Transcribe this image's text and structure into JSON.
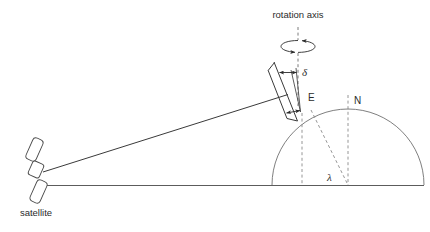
{
  "figure": {
    "type": "diagram",
    "background_color": "#ffffff",
    "line_color": "#3a3a3a",
    "dashed_color": "#8a8a8a",
    "dome_color": "#707070",
    "label_color": "#2b2b2b",
    "width": 430,
    "height": 232
  },
  "labels": {
    "rotation_axis": "rotation axis",
    "delta": "δ",
    "elevation": "E",
    "north": "N",
    "lambda": "λ",
    "satellite": "satellite"
  },
  "elements": {
    "rotation_axis_icon": "rotation-arrow-ellipse",
    "satellite_icon": "satellite-body-with-two-solar-panels",
    "earth_icon": "earth-dome-semicircle",
    "antenna_icon": "tilted-antenna-dish",
    "beam_icon": "satellite-signal-beam-line",
    "ground_icon": "horizontal-ground-line"
  },
  "geometry": {
    "ground_line": {
      "x1": 45,
      "y1": 185,
      "x2": 424,
      "y2": 185
    },
    "dome": {
      "center_x": 348,
      "center_y": 185,
      "radius": 76
    },
    "rotation_axis_line": {
      "x": 298,
      "y_top": 28,
      "y_bottom": 104
    },
    "north_axis_line": {
      "x": 348,
      "y_top": 96,
      "y_bottom": 185
    },
    "local_vertical_line": {
      "x": 302,
      "y_top": 112,
      "y_bottom": 185
    },
    "lambda_ray": {
      "x1": 310,
      "y1": 108,
      "x2": 348,
      "y2": 185
    },
    "beam_line": {
      "x1": 42,
      "y1": 172,
      "x2": 288,
      "y2": 95
    },
    "antenna_axis": {
      "x1": 276,
      "y1": 63,
      "x2": 296,
      "y2": 119
    },
    "satellite_center": {
      "x": 36,
      "y": 170
    }
  }
}
